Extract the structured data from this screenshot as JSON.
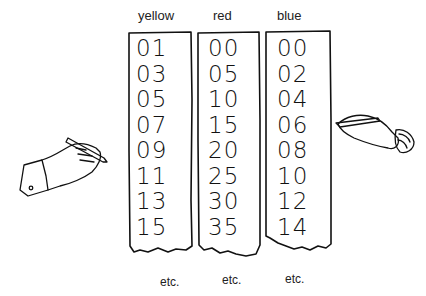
{
  "columns": [
    {
      "label": "yellow",
      "values": [
        "01",
        "03",
        "05",
        "07",
        "09",
        "11",
        "13",
        "15"
      ],
      "footer": "etc."
    },
    {
      "label": "red",
      "values": [
        "00",
        "05",
        "10",
        "15",
        "20",
        "25",
        "30",
        "35"
      ],
      "footer": "etc."
    },
    {
      "label": "blue",
      "values": [
        "00",
        "02",
        "04",
        "06",
        "08",
        "10",
        "12",
        "14"
      ],
      "footer": "etc."
    }
  ],
  "figures": {
    "left_hand": "hand-holding-pencil",
    "right_hand": "hand-holding-pencil"
  }
}
